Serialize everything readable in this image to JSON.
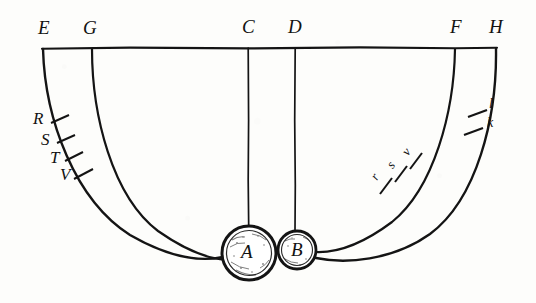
{
  "figure": {
    "background_color": "#fdfdfb",
    "ink_color": "#121212",
    "baseline": {
      "name": "horizontal-baseline",
      "y": 48,
      "x_start": 42,
      "x_end": 497
    },
    "top_labels": [
      {
        "id": "E",
        "text": "E",
        "x": 38,
        "y": 22
      },
      {
        "id": "G",
        "text": "G",
        "x": 84,
        "y": 22
      },
      {
        "id": "C",
        "text": "C",
        "x": 243,
        "y": 21
      },
      {
        "id": "D",
        "text": "D",
        "x": 288,
        "y": 21
      },
      {
        "id": "F",
        "text": "F",
        "x": 450,
        "y": 21
      },
      {
        "id": "H",
        "text": "H",
        "x": 489,
        "y": 21
      }
    ],
    "suspension_points": [
      {
        "id": "E",
        "x": 42,
        "y": 48
      },
      {
        "id": "G",
        "x": 92,
        "y": 48
      },
      {
        "id": "C",
        "x": 248,
        "y": 48
      },
      {
        "id": "D",
        "x": 295,
        "y": 48
      },
      {
        "id": "F",
        "x": 455,
        "y": 48
      },
      {
        "id": "H",
        "x": 497,
        "y": 48
      }
    ],
    "bobs": [
      {
        "id": "A",
        "label": "A",
        "cx": 249,
        "cy": 253,
        "r": 27,
        "label_x": 241,
        "label_y": 243
      },
      {
        "id": "B",
        "label": "B",
        "cx": 297,
        "cy": 250,
        "r": 19,
        "label_x": 290,
        "label_y": 241
      }
    ],
    "vertical_cords": [
      {
        "from": "C",
        "x": 248,
        "y_start": 48,
        "y_end": 226
      },
      {
        "from": "D",
        "x": 295,
        "y_start": 48,
        "y_end": 231
      }
    ],
    "arcs": [
      {
        "id": "arc-E-A",
        "from": "E",
        "to": "A",
        "side": "left",
        "outer": true
      },
      {
        "id": "arc-G-A",
        "from": "G",
        "to": "A",
        "side": "left",
        "outer": false
      },
      {
        "id": "arc-F-B",
        "from": "F",
        "to": "B",
        "side": "right",
        "outer": false
      },
      {
        "id": "arc-H-B",
        "from": "H",
        "to": "B",
        "side": "right",
        "outer": true
      }
    ],
    "left_ticks": [
      {
        "label": "R",
        "tick_x": 59,
        "tick_y": 119,
        "label_x": 38,
        "label_y": 110,
        "angle": -72
      },
      {
        "label": "S",
        "tick_x": 65,
        "tick_y": 139,
        "label_x": 44,
        "label_y": 132,
        "angle": -70
      },
      {
        "label": "T",
        "tick_x": 73,
        "tick_y": 157,
        "label_x": 52,
        "label_y": 150,
        "angle": -66
      },
      {
        "label": "V",
        "tick_x": 83,
        "tick_y": 174,
        "label_x": 62,
        "label_y": 167,
        "angle": -62
      }
    ],
    "right_ticks_outer": [
      {
        "label": "l",
        "tick_x": 477,
        "tick_y": 113,
        "label_x": 489,
        "label_y": 100,
        "angle": 78
      },
      {
        "label": "k",
        "tick_x": 473,
        "tick_y": 131,
        "label_x": 486,
        "label_y": 118,
        "angle": 76
      }
    ],
    "right_ticks_inner": [
      {
        "label": "r",
        "tick_x": 386,
        "tick_y": 184,
        "label_x": 377,
        "label_y": 172,
        "angle": -58,
        "rotate": -58
      },
      {
        "label": "s",
        "tick_x": 400,
        "tick_y": 172,
        "label_x": 392,
        "label_y": 159,
        "angle": -55,
        "rotate": -55
      },
      {
        "label": "v",
        "tick_x": 414,
        "tick_y": 160,
        "label_x": 406,
        "label_y": 147,
        "angle": -52,
        "rotate": -52
      }
    ]
  }
}
